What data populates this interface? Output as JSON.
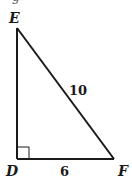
{
  "diagram": {
    "type": "right-triangle",
    "partial_top_text": "g",
    "vertices": {
      "E": {
        "label": "E",
        "x": 17,
        "y": 28
      },
      "D": {
        "label": "D",
        "x": 17,
        "y": 159
      },
      "F": {
        "label": "F",
        "x": 114,
        "y": 159
      }
    },
    "sides": {
      "EF": {
        "label": "10",
        "role": "hypotenuse"
      },
      "DF": {
        "label": "6",
        "role": "leg"
      },
      "DE": {
        "label": "",
        "role": "leg"
      }
    },
    "right_angle_at": "D",
    "colors": {
      "stroke": "#1a1a1a",
      "background": "#ffffff"
    }
  }
}
